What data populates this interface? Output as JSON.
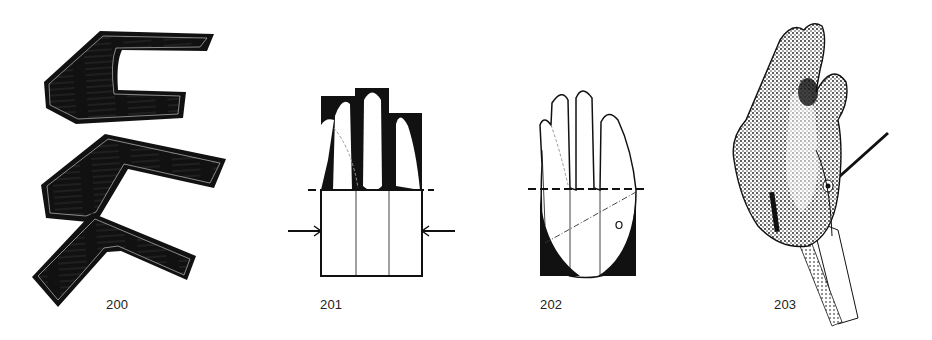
{
  "figures": [
    {
      "id": "fig-200",
      "label": "200",
      "description": "Three wooden hand-splint blanks with wood-grain hatching"
    },
    {
      "id": "fig-201",
      "label": "201",
      "description": "Hand outline inside rectangular pattern with dashed cut line and side pressure arrows"
    },
    {
      "id": "fig-202",
      "label": "202",
      "description": "Hand outline with dashed cut line, dash-dot diagonal and palm mark"
    },
    {
      "id": "fig-203",
      "label": "203",
      "description": "Stippled sculpted hand on a stand with rod and strip"
    }
  ],
  "colors": {
    "ink": "#111111",
    "paper": "#ffffff",
    "label": "#222222"
  }
}
